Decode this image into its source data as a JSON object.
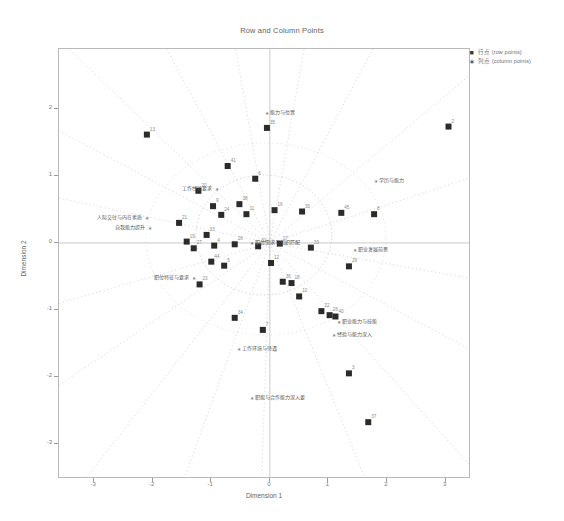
{
  "title": "Row and Column Points",
  "axes": {
    "xlabel": "Dimension 1",
    "ylabel": "Dimension 2",
    "xticks": [
      "-3",
      "-2",
      "-1",
      "0",
      "1",
      "2",
      "3"
    ],
    "yticks": [
      "2",
      "1",
      "0",
      "-1",
      "-2",
      "-3"
    ]
  },
  "legend": {
    "items": [
      {
        "marker": "■",
        "label": "行点 (row points)"
      },
      {
        "marker": "∗",
        "label": "列点 (column points)"
      }
    ]
  },
  "chart_data": {
    "type": "scatter",
    "title": "Row and Column Points",
    "xlabel": "Dimension 1",
    "ylabel": "Dimension 2",
    "xlim": [
      -3.6,
      3.4
    ],
    "ylim": [
      -3.5,
      2.9
    ],
    "grid": false,
    "legend_position": "top-right outside",
    "series": [
      {
        "name": "行点 (row points)",
        "marker": "square",
        "color": "#2b2b2b",
        "points": [
          {
            "label": "13",
            "x": -2.1,
            "y": 1.62
          },
          {
            "label": "41",
            "x": -0.72,
            "y": 1.15
          },
          {
            "label": "20",
            "x": -1.22,
            "y": 0.78
          },
          {
            "label": "2",
            "x": 3.05,
            "y": 1.74
          },
          {
            "label": "35",
            "x": -0.05,
            "y": 1.72
          },
          {
            "label": "6",
            "x": -0.25,
            "y": 0.96
          },
          {
            "label": "9",
            "x": -0.97,
            "y": 0.55
          },
          {
            "label": "38",
            "x": -0.52,
            "y": 0.58
          },
          {
            "label": "11",
            "x": -0.4,
            "y": 0.43
          },
          {
            "label": "24",
            "x": -0.83,
            "y": 0.42
          },
          {
            "label": "16",
            "x": 0.08,
            "y": 0.49
          },
          {
            "label": "30",
            "x": 0.55,
            "y": 0.47
          },
          {
            "label": "45",
            "x": 1.22,
            "y": 0.45
          },
          {
            "label": "8",
            "x": 1.78,
            "y": 0.43
          },
          {
            "label": "21",
            "x": -1.55,
            "y": 0.3
          },
          {
            "label": "33",
            "x": -1.08,
            "y": 0.12
          },
          {
            "label": "19",
            "x": -1.42,
            "y": 0.02
          },
          {
            "label": "27",
            "x": -1.3,
            "y": -0.08
          },
          {
            "label": "4",
            "x": -0.95,
            "y": -0.04
          },
          {
            "label": "26",
            "x": -0.6,
            "y": -0.02
          },
          {
            "label": "31",
            "x": -0.2,
            "y": -0.05
          },
          {
            "label": "17",
            "x": 0.17,
            "y": -0.01
          },
          {
            "label": "39",
            "x": 0.7,
            "y": -0.07
          },
          {
            "label": "44",
            "x": -1.0,
            "y": -0.28
          },
          {
            "label": "5",
            "x": -0.78,
            "y": -0.34
          },
          {
            "label": "12",
            "x": 0.02,
            "y": -0.3
          },
          {
            "label": "29",
            "x": 1.35,
            "y": -0.35
          },
          {
            "label": "23",
            "x": -1.2,
            "y": -0.62
          },
          {
            "label": "36",
            "x": 0.22,
            "y": -0.58
          },
          {
            "label": "18",
            "x": 0.37,
            "y": -0.6
          },
          {
            "label": "10",
            "x": 0.5,
            "y": -0.8
          },
          {
            "label": "22",
            "x": 0.88,
            "y": -1.02
          },
          {
            "label": "28",
            "x": 1.02,
            "y": -1.08
          },
          {
            "label": "40",
            "x": 1.12,
            "y": -1.1
          },
          {
            "label": "34",
            "x": -0.6,
            "y": -1.12
          },
          {
            "label": "7",
            "x": -0.12,
            "y": -1.3
          },
          {
            "label": "3",
            "x": 1.35,
            "y": -1.95
          },
          {
            "label": "37",
            "x": 1.68,
            "y": -2.68
          }
        ]
      },
      {
        "name": "列点 (column points)",
        "marker": "star",
        "color": "#6f6f6f",
        "points": [
          {
            "label": "能力与位置",
            "x": -0.05,
            "y": 1.95
          },
          {
            "label": "学历与能力",
            "x": 1.82,
            "y": 0.92
          },
          {
            "label": "工作经验要求",
            "x": -0.9,
            "y": 0.8
          },
          {
            "label": "人际交往与内在素质",
            "x": -2.1,
            "y": 0.38
          },
          {
            "label": "自我能力提升",
            "x": -2.05,
            "y": 0.22
          },
          {
            "label": "职位需求与组织匹配",
            "x": -0.3,
            "y": 0.0
          },
          {
            "label": "职业发展前景",
            "x": 1.45,
            "y": -0.1
          },
          {
            "label": "职位特征与要求",
            "x": -1.3,
            "y": -0.52
          },
          {
            "label": "职业能力与技能",
            "x": 1.18,
            "y": -1.18
          },
          {
            "label": "经验与能力深入",
            "x": 1.1,
            "y": -1.38
          },
          {
            "label": "工作环境与待遇",
            "x": -0.52,
            "y": -1.58
          },
          {
            "label": "职能与合作能力深入要",
            "x": -0.3,
            "y": -2.32
          }
        ]
      }
    ],
    "reference_lines": {
      "x_zero": 0,
      "y_zero": 0
    },
    "overlays": "dotted radial rays and a dotted ellipse centered near the origin"
  }
}
